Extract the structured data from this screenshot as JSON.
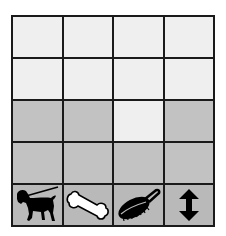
{
  "grid": {
    "rows": 5,
    "cols": 4,
    "colors": {
      "light": "#efefef",
      "dark": "#c2c2c2",
      "icon_row": "#b9b9b9",
      "border": "#1a1a1a"
    },
    "cells": [
      [
        "light",
        "light",
        "light",
        "light"
      ],
      [
        "light",
        "light",
        "light",
        "light"
      ],
      [
        "dark",
        "dark",
        "light",
        "dark"
      ],
      [
        "dark",
        "dark",
        "dark",
        "dark"
      ]
    ],
    "icon_row": [
      {
        "icon": "dog-on-leash-icon"
      },
      {
        "icon": "bone-icon"
      },
      {
        "icon": "brush-icon"
      },
      {
        "icon": "up-down-arrow-icon"
      }
    ]
  }
}
